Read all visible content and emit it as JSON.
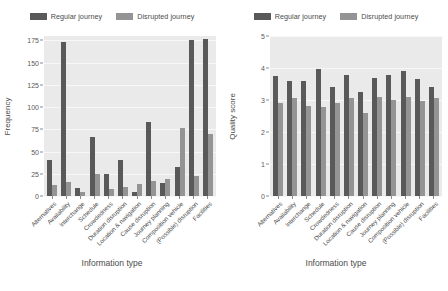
{
  "figure": {
    "legend": {
      "items": [
        {
          "label": "Regular journey",
          "color": "#595959"
        },
        {
          "label": "Disrupted journey",
          "color": "#949494"
        }
      ]
    }
  },
  "chart_data": [
    {
      "type": "bar",
      "title": "",
      "xlabel": "Information type",
      "ylabel": "Frequency",
      "ylim": [
        0,
        180
      ],
      "yticks": [
        0,
        25,
        50,
        75,
        100,
        125,
        150,
        175
      ],
      "grid": true,
      "legend_position": "top",
      "categories": [
        "Alternatives",
        "Availability",
        "Interchange",
        "Schedule",
        "Crowdedness",
        "Duration disruption",
        "Location & navigation",
        "Cause disruption",
        "Journey planning",
        "Composition vehicle",
        "(Possible) disruption",
        "Facilities"
      ],
      "series": [
        {
          "name": "Regular journey",
          "color": "#595959",
          "values": [
            41,
            173,
            9,
            66,
            25,
            40,
            4,
            83,
            15,
            33,
            175,
            177
          ]
        },
        {
          "name": "Disrupted journey",
          "color": "#949494",
          "values": [
            12,
            16,
            5,
            25,
            8,
            10,
            13,
            17,
            19,
            77,
            22,
            70
          ]
        }
      ]
    },
    {
      "type": "bar",
      "title": "",
      "xlabel": "Information type",
      "ylabel": "Quality score",
      "ylim": [
        0,
        5
      ],
      "yticks": [
        0,
        1,
        2,
        3,
        4,
        5
      ],
      "grid": true,
      "legend_position": "top",
      "categories": [
        "Alternatives",
        "Availability",
        "Interchange",
        "Schedule",
        "Crowdedness",
        "Duration disruption",
        "Location & navigation",
        "Cause disruption",
        "Journey planning",
        "Composition vehicle",
        "(Possible) disruption",
        "Facilities"
      ],
      "series": [
        {
          "name": "Regular journey",
          "color": "#595959",
          "values": [
            3.75,
            3.58,
            3.6,
            3.97,
            3.42,
            3.77,
            3.25,
            3.68,
            3.78,
            3.92,
            3.65,
            3.42
          ]
        },
        {
          "name": "Disrupted journey",
          "color": "#949494",
          "values": [
            2.9,
            3.05,
            2.82,
            2.78,
            2.9,
            3.05,
            2.58,
            3.1,
            3.0,
            3.1,
            2.97,
            3.05
          ]
        }
      ]
    }
  ]
}
